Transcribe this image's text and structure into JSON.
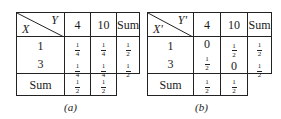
{
  "tables": [
    {
      "id": "a",
      "caption": "(a)",
      "row_var": "X",
      "col_var": "Y",
      "col_headers": [
        "4",
        "10",
        "Sum"
      ],
      "rows": [
        {
          "label": "1",
          "cells": [
            {
              "n": "1",
              "d": "4"
            },
            {
              "n": "1",
              "d": "4"
            },
            {
              "n": "1",
              "d": "2"
            }
          ]
        },
        {
          "label": "3",
          "cells": [
            {
              "n": "1",
              "d": "4"
            },
            {
              "n": "1",
              "d": "4"
            },
            {
              "n": "1",
              "d": "2"
            }
          ]
        }
      ],
      "sum_row": {
        "label": "Sum",
        "cells": [
          {
            "n": "1",
            "d": "2"
          },
          {
            "n": "1",
            "d": "2"
          }
        ]
      }
    },
    {
      "id": "b",
      "caption": "(b)",
      "row_var": "X'",
      "col_var": "Y'",
      "col_headers": [
        "4",
        "10",
        "Sum"
      ],
      "rows": [
        {
          "label": "1",
          "cells": [
            {
              "v": "0"
            },
            {
              "n": "1",
              "d": "2"
            },
            {
              "n": "1",
              "d": "2"
            }
          ]
        },
        {
          "label": "3",
          "cells": [
            {
              "n": "1",
              "d": "2"
            },
            {
              "v": "0"
            },
            {
              "n": "1",
              "d": "2"
            }
          ]
        }
      ],
      "sum_row": {
        "label": "Sum",
        "cells": [
          {
            "n": "1",
            "d": "2"
          },
          {
            "n": "1",
            "d": "2"
          }
        ]
      }
    }
  ]
}
